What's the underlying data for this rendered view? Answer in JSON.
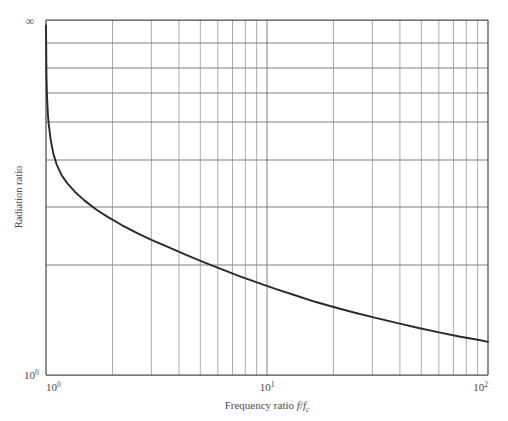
{
  "chart_data": {
    "type": "line",
    "title": "",
    "xlabel": "Frequency ratio f/f",
    "xlabel_sub": "c",
    "ylabel": "Radiation ratio",
    "xscale": "log",
    "yscale": "log",
    "xlim": [
      1,
      100
    ],
    "ylim": [
      1,
      1000000
    ],
    "grid": true,
    "legend": null,
    "x_ticks": [
      {
        "value": 1,
        "label": "10",
        "exp": "0"
      },
      {
        "value": 10,
        "label": "10",
        "exp": "1"
      },
      {
        "value": 100,
        "label": "10",
        "exp": "2"
      }
    ],
    "y_ticks": [
      {
        "value": 1,
        "label": "10",
        "exp": "0"
      },
      {
        "value": 1000000,
        "label": "∞",
        "exp": ""
      }
    ],
    "y_axis_top_symbol": "∞",
    "series": [
      {
        "name": "Radiation ratio",
        "x": [
          1.0,
          1.005,
          1.01,
          1.02,
          1.03,
          1.05,
          1.08,
          1.12,
          1.18,
          1.25,
          1.35,
          1.5,
          1.7,
          1.9,
          2.2,
          2.6,
          3.0,
          3.6,
          4.3,
          5.2,
          6.3,
          7.6,
          9.2,
          11.0,
          13.5,
          16.5,
          20.0,
          25.0,
          31.0,
          39.0,
          48.0,
          60.0,
          75.0,
          90.0,
          100.0
        ],
        "y": [
          600000.0,
          9000.0,
          2700.0,
          740.0,
          400.0,
          180.0,
          88.0,
          52.0,
          33.0,
          24.0,
          17.5,
          12.6,
          9.3,
          7.5,
          5.9,
          4.7,
          4.0,
          3.35,
          2.85,
          2.45,
          2.15,
          1.92,
          1.74,
          1.6,
          1.48,
          1.38,
          1.31,
          1.245,
          1.195,
          1.152,
          1.12,
          1.093,
          1.071,
          1.058,
          1.05
        ]
      }
    ],
    "annotations": []
  },
  "axes": {
    "x_axis_title_prefix": "Frequency ratio ",
    "x_axis_title_italic_f": "f",
    "x_axis_title_slash": "/",
    "x_axis_title_italic_f2": "f",
    "x_axis_title_sub_c": "c",
    "y_axis_title": "Radiation ratio"
  }
}
